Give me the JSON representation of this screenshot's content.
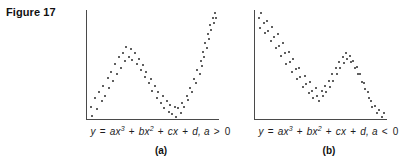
{
  "figure": {
    "title": "Figure 17",
    "background": "#ffffff",
    "axis_color": "#4a4a4a",
    "dot_color": "#2b2b2b"
  },
  "panels": [
    {
      "id": "a",
      "label": "(a)",
      "equation_text": "y = ax3 + bx2 + cx + d, a > 0",
      "equation_parts": {
        "lhs": "y",
        "eq": "=",
        "t1_coef": "ax",
        "t1_pow": "3",
        "plus1": "+",
        "t2_coef": "bx",
        "t2_pow": "2",
        "plus2": "+",
        "t3": "cx",
        "plus3": "+",
        "t4": "d,",
        "condition_var": "a",
        "condition_op": ">",
        "condition_val": "0"
      }
    },
    {
      "id": "b",
      "label": "(b)",
      "equation_text": "y = ax3 + bx2 + cx + d, a < 0",
      "equation_parts": {
        "lhs": "y",
        "eq": "=",
        "t1_coef": "ax",
        "t1_pow": "3",
        "plus1": "+",
        "t2_coef": "bx",
        "t2_pow": "2",
        "plus2": "+",
        "t3": "cx",
        "plus3": "+",
        "t4": "d,",
        "condition_var": "a",
        "condition_op": "<",
        "condition_val": "0"
      }
    }
  ],
  "chart_data": [
    {
      "type": "scatter",
      "title": "y = ax3 + bx2 + cx + d, a > 0",
      "xlabel": "",
      "ylabel": "",
      "xlim": [
        0,
        100
      ],
      "ylim": [
        0,
        100
      ],
      "grid": false,
      "legend": "none",
      "series": [
        {
          "name": "cubic-positive-leading-coefficient",
          "points": [
            [
              2,
              22
            ],
            [
              3,
              15
            ],
            [
              5,
              29
            ],
            [
              7,
              20
            ],
            [
              9,
              33
            ],
            [
              11,
              26
            ],
            [
              12,
              38
            ],
            [
              14,
              30
            ],
            [
              16,
              44
            ],
            [
              17,
              36
            ],
            [
              19,
              49
            ],
            [
              21,
              42
            ],
            [
              22,
              55
            ],
            [
              24,
              47
            ],
            [
              26,
              60
            ],
            [
              27,
              52
            ],
            [
              29,
              63
            ],
            [
              31,
              57
            ],
            [
              32,
              68
            ],
            [
              34,
              60
            ],
            [
              36,
              66
            ],
            [
              37,
              58
            ],
            [
              39,
              63
            ],
            [
              41,
              55
            ],
            [
              43,
              59
            ],
            [
              44,
              50
            ],
            [
              46,
              54
            ],
            [
              48,
              45
            ],
            [
              49,
              49
            ],
            [
              51,
              40
            ],
            [
              53,
              43
            ],
            [
              54,
              34
            ],
            [
              56,
              38
            ],
            [
              58,
              29
            ],
            [
              59,
              33
            ],
            [
              61,
              25
            ],
            [
              63,
              30
            ],
            [
              64,
              21
            ],
            [
              66,
              26
            ],
            [
              68,
              18
            ],
            [
              69,
              23
            ],
            [
              71,
              16
            ],
            [
              73,
              22
            ],
            [
              74,
              14
            ],
            [
              76,
              21
            ],
            [
              78,
              17
            ],
            [
              79,
              25
            ],
            [
              81,
              22
            ],
            [
              83,
              30
            ],
            [
              84,
              27
            ],
            [
              86,
              36
            ],
            [
              88,
              33
            ],
            [
              89,
              43
            ],
            [
              91,
              40
            ],
            [
              92,
              50
            ],
            [
              94,
              47
            ],
            [
              95,
              57
            ],
            [
              96,
              53
            ],
            [
              97,
              64
            ],
            [
              98,
              60
            ],
            [
              99,
              71
            ],
            [
              100,
              67
            ],
            [
              101,
              78
            ],
            [
              102,
              74
            ],
            [
              103,
              85
            ],
            [
              104,
              81
            ],
            [
              105,
              90
            ],
            [
              106,
              86
            ],
            [
              107,
              94
            ],
            [
              108,
              90
            ]
          ]
        }
      ]
    },
    {
      "type": "scatter",
      "title": "y = ax3 + bx2 + cx + d, a < 0",
      "xlabel": "",
      "ylabel": "",
      "xlim": [
        0,
        100
      ],
      "ylim": [
        0,
        100
      ],
      "grid": false,
      "legend": "none",
      "series": [
        {
          "name": "cubic-negative-leading-coefficient",
          "points": [
            [
              2,
              90
            ],
            [
              3,
              82
            ],
            [
              4,
              94
            ],
            [
              6,
              86
            ],
            [
              7,
              78
            ],
            [
              9,
              88
            ],
            [
              10,
              80
            ],
            [
              12,
              72
            ],
            [
              13,
              83
            ],
            [
              15,
              75
            ],
            [
              16,
              66
            ],
            [
              18,
              77
            ],
            [
              19,
              68
            ],
            [
              21,
              60
            ],
            [
              22,
              70
            ],
            [
              24,
              62
            ],
            [
              25,
              53
            ],
            [
              27,
              63
            ],
            [
              28,
              55
            ],
            [
              30,
              47
            ],
            [
              31,
              57
            ],
            [
              33,
              49
            ],
            [
              34,
              41
            ],
            [
              36,
              50
            ],
            [
              37,
              43
            ],
            [
              39,
              35
            ],
            [
              41,
              44
            ],
            [
              42,
              37
            ],
            [
              44,
              30
            ],
            [
              45,
              39
            ],
            [
              47,
              32
            ],
            [
              48,
              26
            ],
            [
              50,
              34
            ],
            [
              51,
              28
            ],
            [
              53,
              24
            ],
            [
              55,
              32
            ],
            [
              56,
              28
            ],
            [
              58,
              36
            ],
            [
              59,
              31
            ],
            [
              61,
              40
            ],
            [
              62,
              35
            ],
            [
              64,
              45
            ],
            [
              65,
              40
            ],
            [
              67,
              50
            ],
            [
              68,
              45
            ],
            [
              70,
              55
            ],
            [
              71,
              50
            ],
            [
              73,
              59
            ],
            [
              74,
              54
            ],
            [
              76,
              62
            ],
            [
              77,
              57
            ],
            [
              79,
              60
            ],
            [
              80,
              55
            ],
            [
              82,
              56
            ],
            [
              83,
              50
            ],
            [
              85,
              51
            ],
            [
              86,
              45
            ],
            [
              88,
              45
            ],
            [
              89,
              39
            ],
            [
              91,
              38
            ],
            [
              92,
              33
            ],
            [
              94,
              31
            ],
            [
              95,
              26
            ],
            [
              97,
              24
            ],
            [
              98,
              19
            ],
            [
              100,
              20
            ],
            [
              102,
              14
            ],
            [
              104,
              17
            ],
            [
              106,
              11
            ],
            [
              108,
              14
            ]
          ]
        }
      ]
    }
  ]
}
